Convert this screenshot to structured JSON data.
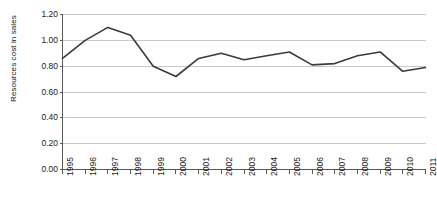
{
  "chart_data": {
    "type": "line",
    "title": "",
    "xlabel": "",
    "ylabel": "Resources cost in sales",
    "categories": [
      "1995",
      "1996",
      "1997",
      "1998",
      "1999",
      "2000",
      "2001",
      "2002",
      "2003",
      "2004",
      "2005",
      "2006",
      "2007",
      "2008",
      "2009",
      "2010",
      "2011"
    ],
    "values": [
      0.86,
      1.0,
      1.1,
      1.04,
      0.8,
      0.72,
      0.86,
      0.9,
      0.85,
      0.88,
      0.91,
      0.81,
      0.82,
      0.88,
      0.91,
      0.76,
      0.79
    ],
    "series": [
      {
        "name": "Resources cost in sales",
        "values": [
          0.86,
          1.0,
          1.1,
          1.04,
          0.8,
          0.72,
          0.86,
          0.9,
          0.85,
          0.88,
          0.91,
          0.81,
          0.82,
          0.88,
          0.91,
          0.76,
          0.79
        ]
      }
    ],
    "ylim": [
      0.0,
      1.2
    ],
    "yticks": [
      0.0,
      0.2,
      0.4,
      0.6,
      0.8,
      1.0,
      1.2
    ],
    "ytick_labels": [
      "0.00",
      "0.20",
      "0.40",
      "0.60",
      "0.80",
      "1.00",
      "1.20"
    ],
    "grid": true,
    "grid_axis": "y",
    "legend": false,
    "legend_position": "none",
    "line_color": "#3a3a3a",
    "grid_color": "#c8c8c8",
    "axis_color": "#595959",
    "background_color": "#ffffff",
    "xtick_rotation": -90
  }
}
